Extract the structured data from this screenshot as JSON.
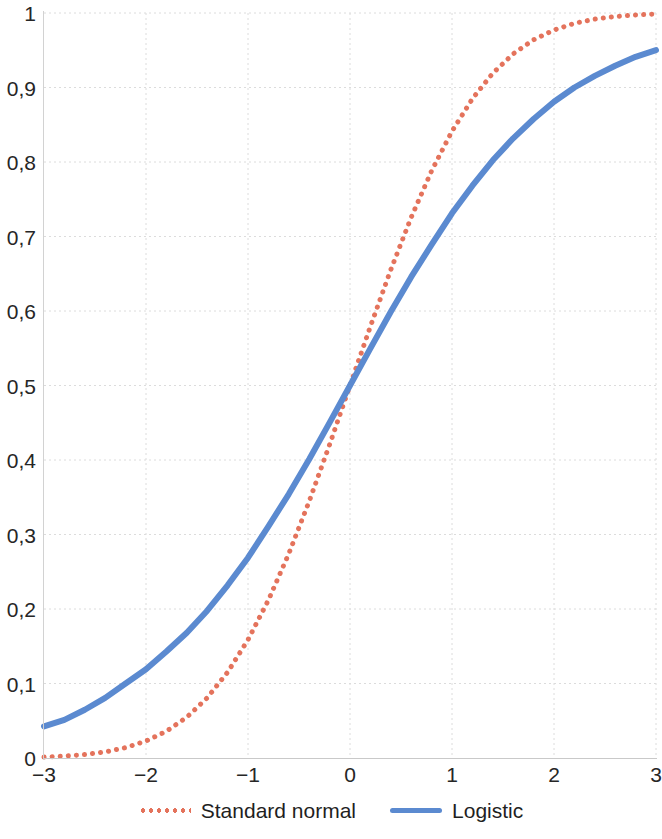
{
  "chart_data": {
    "type": "line",
    "title": "",
    "subtitle": "",
    "xlabel": "",
    "ylabel": "",
    "xlim": [
      -3,
      3
    ],
    "ylim": [
      0,
      1
    ],
    "grid": true,
    "grid_style": "dotted",
    "legend_position": "bottom-center",
    "x_tick_labels": [
      "-3",
      "-2",
      "-1",
      "0",
      "1",
      "2",
      "3"
    ],
    "x_ticks": [
      -3,
      -2,
      -1,
      0,
      1,
      2,
      3
    ],
    "y_tick_labels": [
      "0",
      "0,1",
      "0,2",
      "0,3",
      "0,4",
      "0,5",
      "0,6",
      "0,7",
      "0,8",
      "0,9",
      "1"
    ],
    "y_ticks": [
      0,
      0.1,
      0.2,
      0.3,
      0.4,
      0.5,
      0.6,
      0.7,
      0.8,
      0.9,
      1
    ],
    "decimal_separator": ",",
    "x": [
      -3,
      -2.8,
      -2.6,
      -2.4,
      -2.2,
      -2,
      -1.8,
      -1.6,
      -1.4,
      -1.2,
      -1,
      -0.8,
      -0.6,
      -0.4,
      -0.2,
      0,
      0.2,
      0.4,
      0.6,
      0.8,
      1,
      1.2,
      1.4,
      1.6,
      1.8,
      2,
      2.2,
      2.4,
      2.6,
      2.8,
      3
    ],
    "series": [
      {
        "name": "Standard normal",
        "color": "#e4735c",
        "style": "dotted",
        "width": 5,
        "values": [
          0.0013,
          0.0026,
          0.0047,
          0.0082,
          0.0139,
          0.0228,
          0.0359,
          0.0548,
          0.0808,
          0.1151,
          0.1587,
          0.2119,
          0.2743,
          0.3446,
          0.4207,
          0.5,
          0.5793,
          0.6554,
          0.7257,
          0.7881,
          0.8413,
          0.8849,
          0.9192,
          0.9452,
          0.9641,
          0.9772,
          0.9861,
          0.9918,
          0.9953,
          0.9974,
          0.9987
        ]
      },
      {
        "name": "Logistic",
        "color": "#5b8ad0",
        "style": "solid",
        "width": 6,
        "values": [
          0.0424,
          0.0512,
          0.0648,
          0.0807,
          0.1,
          0.1192,
          0.143,
          0.1682,
          0.1977,
          0.2318,
          0.2689,
          0.3109,
          0.3543,
          0.401,
          0.4502,
          0.5,
          0.5498,
          0.599,
          0.6457,
          0.6891,
          0.7311,
          0.7682,
          0.8023,
          0.8318,
          0.8577,
          0.8808,
          0.9,
          0.9156,
          0.9292,
          0.9412,
          0.9502
        ]
      }
    ]
  },
  "axes": {
    "y_labels": [
      "1",
      "0,9",
      "0,8",
      "0,7",
      "0,6",
      "0,5",
      "0,4",
      "0,3",
      "0,2",
      "0,1",
      "0"
    ],
    "x_labels": [
      "-3",
      "-2",
      "-1",
      "0",
      "1",
      "2",
      "3"
    ]
  },
  "legend": {
    "items": [
      {
        "label": "Standard normal",
        "icon": "dotted-line-icon",
        "color": "#e4735c",
        "style": "dotted"
      },
      {
        "label": "Logistic",
        "icon": "solid-line-icon",
        "color": "#5b8ad0",
        "style": "solid"
      }
    ]
  },
  "colors": {
    "standard_normal": "#e4735c",
    "logistic": "#5b8ad0",
    "gridline": "#dcdcdc",
    "axis": "#c9c9c9",
    "text": "#262626",
    "background": "#ffffff"
  }
}
